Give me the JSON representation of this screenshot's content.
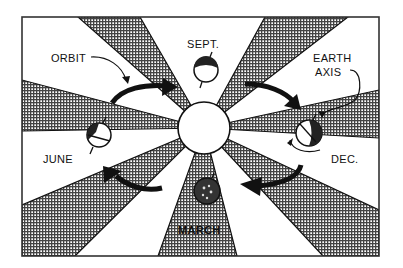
{
  "diagram": {
    "labels": {
      "orbit": "ORBIT",
      "sept": "SEPT.",
      "earth_axis_line1": "EARTH",
      "earth_axis_line2": "AXIS",
      "june": "JUNE",
      "dec": "DEC.",
      "march": "MARCH"
    },
    "elements": {
      "sun": "sun",
      "earth_positions": [
        "SEPT.",
        "DEC.",
        "MARCH",
        "JUNE"
      ],
      "orbit_arrows": 4
    },
    "colors": {
      "ink": "#111111",
      "background": "#ffffff",
      "shading": "#8a8a8a"
    }
  }
}
